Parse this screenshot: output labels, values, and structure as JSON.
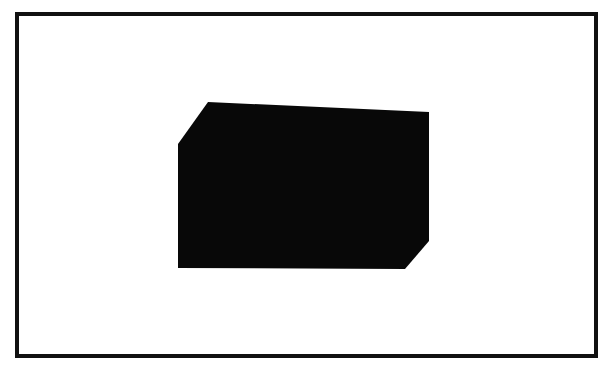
{
  "figure": {
    "caption": "A solid black polygon with chamfered top-left and bottom-right corners, drawn on a white field enclosed by a thin black rectangular border.",
    "background_color": "#ffffff",
    "canvas": {
      "width": 612,
      "height": 376
    }
  },
  "frame": {
    "name": "outer-border",
    "stroke_color": "#111111",
    "fill_color": "#ffffff",
    "stroke_width": 4,
    "x": 17,
    "y": 14,
    "width": 579,
    "height": 342
  },
  "shape": {
    "name": "black-hexagon-silhouette",
    "fill_color": "#080808",
    "sides": 6,
    "bounds": {
      "left": 178,
      "top": 102,
      "right": 429,
      "bottom": 269
    },
    "points": [
      {
        "x": 208,
        "y": 102
      },
      {
        "x": 429,
        "y": 112
      },
      {
        "x": 429,
        "y": 241
      },
      {
        "x": 405,
        "y": 269
      },
      {
        "x": 178,
        "y": 268
      },
      {
        "x": 178,
        "y": 144
      }
    ],
    "chamfers": [
      {
        "corner": "top-left",
        "from_x": 178,
        "from_y": 144,
        "to_x": 208,
        "to_y": 102
      },
      {
        "corner": "bottom-right",
        "from_x": 429,
        "from_y": 241,
        "to_x": 405,
        "to_y": 269
      }
    ]
  }
}
